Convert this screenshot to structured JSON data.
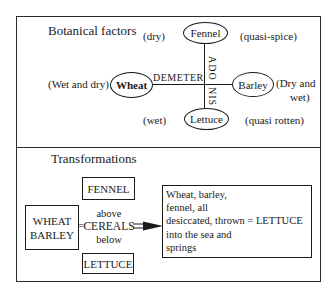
{
  "top_panel": {
    "title": "Botanical factors",
    "nodes": {
      "fennel": {
        "label": "Fennel",
        "left_note": "(dry)",
        "right_note": "(quasi-spice)"
      },
      "wheat": {
        "label": "Wheat",
        "left_note": "(Wet and dry)"
      },
      "barley": {
        "label": "Barley",
        "right_note_line1": "(Dry and",
        "right_note_line2": "wet)"
      },
      "lettuce": {
        "label": "Lettuce",
        "left_note": "(wet)",
        "right_note": "(quasi rotten)"
      }
    },
    "axes": {
      "horizontal_label": "DEMETER",
      "vertical_label_top": "ADO",
      "vertical_label_bottom": "NIS"
    }
  },
  "bottom_panel": {
    "title": "Transformations",
    "fennel_box": "FENNEL",
    "wheat_barley_box": {
      "line1": "WHEAT",
      "line2": "BARLEY"
    },
    "equals_left": "=",
    "cereals": {
      "above": "above",
      "label": "CEREALS",
      "below": "below"
    },
    "lettuce_box": "LETTUCE",
    "result": {
      "lines": [
        "Wheat, barley,",
        "fennel, all",
        "desiccated, thrown = LETTUCE",
        "into the sea and",
        "springs"
      ]
    }
  }
}
